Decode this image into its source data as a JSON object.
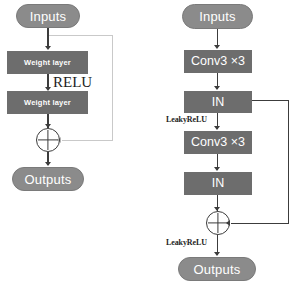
{
  "figure": {
    "background_color": "#ffffff",
    "box_color": "#6d6d6d",
    "pill_color": "#8b8b8b",
    "line_color": "#3c3c3c",
    "faint_line_color": "#c9c9c9"
  },
  "left_diagram": {
    "name": "classic-residual-block",
    "input_label": "Inputs",
    "block1_label": "Weight layer",
    "activation_label": "RELU",
    "block2_label": "Weight layer",
    "sum_label": "+",
    "output_label": "Outputs"
  },
  "right_diagram": {
    "name": "instance-norm-residual-block",
    "input_label": "Inputs",
    "conv1_label": "Conv3 ×3",
    "norm1_label": "IN",
    "activation1_label": "LeakyReLU",
    "conv2_label": "Conv3 ×3",
    "norm2_label": "IN",
    "sum_label": "+",
    "activation2_label": "LeakyReLU",
    "output_label": "Outputs"
  }
}
